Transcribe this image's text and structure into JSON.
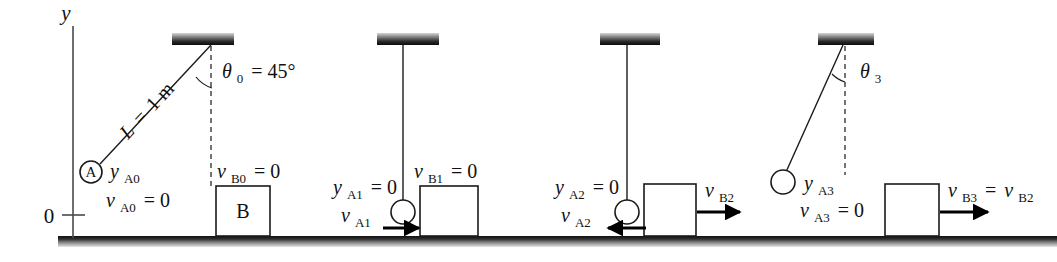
{
  "figure": {
    "axis": {
      "y_label": "y",
      "origin_label": "0"
    },
    "colors": {
      "ink": "#111111",
      "ground_dark": "#1d1d1d",
      "ground_light": "#d8d8d8",
      "support_dark": "#101010",
      "support_light": "#cfcfcf",
      "background": "#ffffff"
    },
    "panels": [
      {
        "id": "panel-0",
        "stage": "initial-release",
        "string_label": "L = 1 m",
        "angle_label": "θ₀ = 45°",
        "angle_value": "45",
        "ball_marker": "A",
        "ball_labels": [
          "yₐ₀",
          "vₐ₀ = 0"
        ],
        "block_labels": [
          "vᴮ₀ = 0"
        ],
        "block_name": "B",
        "arrows": []
      },
      {
        "id": "panel-1",
        "stage": "just-before-impact",
        "string_label": "",
        "angle_label": "",
        "ball_marker": "",
        "ball_labels": [
          "yₐ₁ = 0",
          "vₐ₁"
        ],
        "block_labels": [
          "vᴮ₁ = 0"
        ],
        "block_name": "",
        "arrows": [
          {
            "name": "v-a1-arrow",
            "direction": "right"
          }
        ]
      },
      {
        "id": "panel-2",
        "stage": "just-after-impact",
        "string_label": "",
        "angle_label": "",
        "ball_marker": "",
        "ball_labels": [
          "yₐ₂ = 0",
          "vₐ₂"
        ],
        "block_labels": [
          "vᴮ₂"
        ],
        "block_name": "",
        "arrows": [
          {
            "name": "v-a2-arrow",
            "direction": "left"
          },
          {
            "name": "v-b2-arrow",
            "direction": "right"
          }
        ]
      },
      {
        "id": "panel-3",
        "stage": "rebound-maximum",
        "string_label": "",
        "angle_label": "θ₃",
        "ball_marker": "",
        "ball_labels": [
          "yₐ₃",
          "vₐ₃ = 0"
        ],
        "block_labels": [
          "vᴮ₃ = vᴮ₂"
        ],
        "block_name": "",
        "arrows": [
          {
            "name": "v-b3-arrow",
            "direction": "right"
          }
        ]
      }
    ],
    "labels": {
      "y_axis": "y",
      "origin": "0",
      "L_equals": "L",
      "L_eq_sign": "=",
      "L_value": "1 m",
      "theta0_sym": "θ",
      "theta0_sub": "0",
      "theta0_eq": "= 45°",
      "theta3_sym": "θ",
      "theta3_sub": "3",
      "ball_A": "A",
      "block_B": "B",
      "yA0_v": "y",
      "yA0_sub": "A0",
      "vA0_v": "v",
      "vA0_sub": "A0",
      "vA0_eq": "= 0",
      "vB0_v": "v",
      "vB0_sub": "B0",
      "vB0_eq": "= 0",
      "yA1_v": "y",
      "yA1_sub": "A1",
      "yA1_eq": "= 0",
      "vA1_v": "v",
      "vA1_sub": "A1",
      "vB1_v": "v",
      "vB1_sub": "B1",
      "vB1_eq": "= 0",
      "yA2_v": "y",
      "yA2_sub": "A2",
      "yA2_eq": "= 0",
      "vA2_v": "v",
      "vA2_sub": "A2",
      "vB2_v": "v",
      "vB2_sub": "B2",
      "yA3_v": "y",
      "yA3_sub": "A3",
      "vA3_v": "v",
      "vA3_sub": "A3",
      "vA3_eq": "= 0",
      "vB3_v": "v",
      "vB3_sub": "B3",
      "vB3_eq": "=",
      "vB3_rhs_v": "v",
      "vB3_rhs_sub": "B2"
    }
  }
}
